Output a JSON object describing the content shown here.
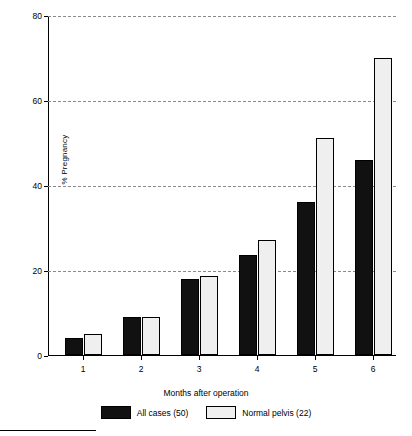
{
  "chart_data": {
    "type": "bar",
    "title": "",
    "xlabel": "Months after operation",
    "ylabel": "% Pregnancy",
    "categories": [
      "1",
      "2",
      "3",
      "4",
      "5",
      "6"
    ],
    "series": [
      {
        "name": "All cases (50)",
        "color": "#111111",
        "values": [
          4,
          9,
          18,
          23.5,
          36,
          46
        ]
      },
      {
        "name": "Normal pelvis (22)",
        "color": "#efefef",
        "values": [
          5,
          9,
          18.5,
          27,
          51,
          70
        ]
      }
    ],
    "ylim": [
      0,
      80
    ],
    "yticks": [
      0,
      20,
      40,
      60,
      80
    ],
    "ytick_labels": [
      "0",
      "20",
      "40",
      "60",
      "80"
    ],
    "grid": "horizontal-dashed",
    "legend_position": "bottom-center"
  },
  "axes": {
    "y_title": "% Pregnancy",
    "x_title": "Months after operation"
  },
  "legend": {
    "entries": [
      {
        "label": "All cases (50)",
        "swatch": "dark"
      },
      {
        "label": "Normal pelvis (22)",
        "swatch": "light"
      }
    ]
  }
}
